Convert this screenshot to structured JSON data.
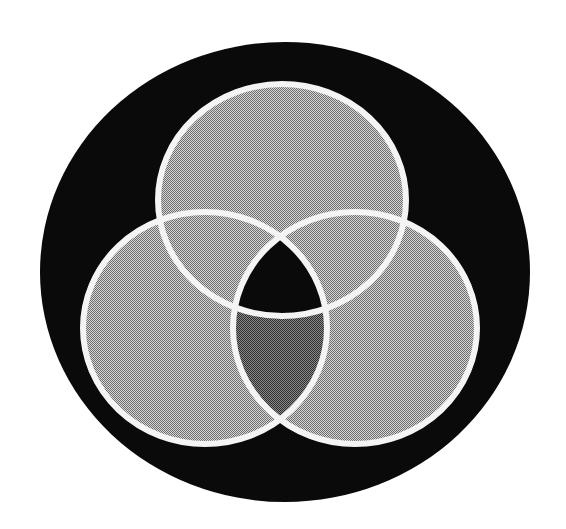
{
  "figure": {
    "type": "venn-diagram",
    "sets": 3,
    "background": "#ffffff"
  },
  "colors": {
    "disc": "#0a0a0a",
    "outline": "#f4f4f4",
    "set_fill_dark": "#6e6e6e",
    "set_fill_light": "#d6d6d6",
    "lens_fill_dark": "#2e2e2e",
    "lens_fill_light": "#8a8a8a",
    "triple_region": "#0a0a0a"
  },
  "shapes": {
    "disc": {
      "cx": 285,
      "cy": 272,
      "rx": 245,
      "ry": 230
    },
    "circle_top": {
      "cx": 282,
      "cy": 200,
      "rx": 124,
      "ry": 116
    },
    "circle_left": {
      "cx": 205,
      "cy": 328,
      "rx": 122,
      "ry": 116
    },
    "circle_right": {
      "cx": 355,
      "cy": 328,
      "rx": 122,
      "ry": 116
    },
    "stroke_width": 6
  }
}
